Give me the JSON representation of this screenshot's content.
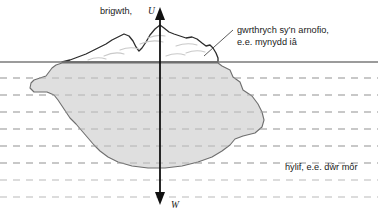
{
  "figure": {
    "labels": {
      "upthrust": "brigwth,",
      "upthrust_symbol": "U",
      "weight_symbol": "W",
      "object_line1": "gwrthrych sy’n arnofio,",
      "object_line2": "e.e. mynydd iâ",
      "liquid": "hylif, e.e. dŵr môr"
    },
    "colors": {
      "background": "#ffffff",
      "iceberg_fill": "#dcdcdc",
      "iceberg_stroke": "#6e6e6e",
      "waterline": "#7a7a7a",
      "dashed_line": "#b4b4b4",
      "arrow": "#111111",
      "text": "#1a1a1a",
      "peak_stroke": "#2b2b2b",
      "leader_line": "#4a4a4a"
    },
    "geometry": {
      "width": 378,
      "height": 218,
      "waterline_y": 62,
      "dashed_line_ys": [
        78,
        95,
        112,
        129,
        146,
        163,
        180,
        197
      ],
      "arrow_x": 160,
      "up_arrow_top_y": 8,
      "up_arrow_bottom_y": 118,
      "down_arrow_top_y": 118,
      "down_arrow_bottom_y": 204,
      "iceberg_bottom_y": 168
    }
  }
}
